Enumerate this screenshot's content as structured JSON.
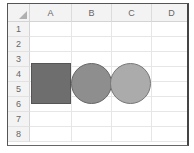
{
  "sheet": {
    "corner_icon": "select-all-triangle-icon",
    "columns": [
      "A",
      "B",
      "C",
      "D"
    ],
    "rows": [
      "1",
      "2",
      "3",
      "4",
      "5",
      "6",
      "7",
      "8"
    ]
  },
  "shapes": [
    {
      "type": "rectangle",
      "fill": "#6e6e6e",
      "border": "#555555"
    },
    {
      "type": "oval",
      "fill": "#8e8e8e",
      "border": "#666666"
    },
    {
      "type": "oval",
      "fill": "#ababab",
      "border": "#777777"
    }
  ]
}
